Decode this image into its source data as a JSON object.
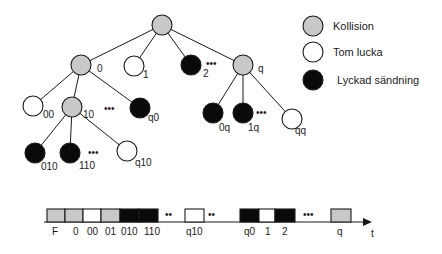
{
  "colors": {
    "collision": "#c8c8c8",
    "empty": "#ffffff",
    "success": "#0a0a0a",
    "stroke": "#1a1a1a"
  },
  "legend": [
    {
      "type": "collision",
      "label": "Kollision"
    },
    {
      "type": "empty",
      "label": "Tom lucka"
    },
    {
      "type": "success",
      "label": "Lyckad sändning"
    }
  ],
  "tree": {
    "nodes": [
      {
        "id": "root",
        "label": "",
        "type": "collision",
        "x": 162,
        "y": 25
      },
      {
        "id": "0",
        "label": "0",
        "type": "collision",
        "x": 81,
        "y": 65
      },
      {
        "id": "1",
        "label": "1",
        "type": "empty",
        "x": 134,
        "y": 66
      },
      {
        "id": "2",
        "label": "2",
        "type": "success",
        "x": 191,
        "y": 65
      },
      {
        "id": "q",
        "label": "q",
        "type": "collision",
        "x": 243,
        "y": 65
      },
      {
        "id": "00",
        "label": "00",
        "type": "empty",
        "x": 33,
        "y": 106
      },
      {
        "id": "10",
        "label": "10",
        "type": "collision",
        "x": 72,
        "y": 107
      },
      {
        "id": "q0",
        "label": "q0",
        "type": "success",
        "x": 140,
        "y": 108
      },
      {
        "id": "0q",
        "label": "0q",
        "type": "success",
        "x": 213,
        "y": 113
      },
      {
        "id": "1q",
        "label": "1q",
        "type": "success",
        "x": 243,
        "y": 113
      },
      {
        "id": "qq",
        "label": "qq",
        "type": "empty",
        "x": 292,
        "y": 119
      },
      {
        "id": "010",
        "label": "010",
        "type": "success",
        "x": 35,
        "y": 153
      },
      {
        "id": "110",
        "label": "110",
        "type": "success",
        "x": 70,
        "y": 153
      },
      {
        "id": "q10",
        "label": "q10",
        "type": "empty",
        "x": 127,
        "y": 151
      }
    ],
    "edges": [
      [
        "root",
        "0"
      ],
      [
        "root",
        "1"
      ],
      [
        "root",
        "2"
      ],
      [
        "root",
        "q"
      ],
      [
        "0",
        "00"
      ],
      [
        "0",
        "10"
      ],
      [
        "0",
        "q0"
      ],
      [
        "q",
        "0q"
      ],
      [
        "q",
        "1q"
      ],
      [
        "q",
        "qq"
      ],
      [
        "10",
        "010"
      ],
      [
        "10",
        "110"
      ],
      [
        "10",
        "q10"
      ]
    ],
    "ellipses": [
      "•••",
      "•••",
      "•••",
      "•••"
    ]
  },
  "timeline": {
    "slots": [
      {
        "label": "F",
        "type": "collision"
      },
      {
        "label": "0",
        "type": "collision"
      },
      {
        "label": "00",
        "type": "empty"
      },
      {
        "label": "01",
        "type": "collision"
      },
      {
        "label": "010",
        "type": "success"
      },
      {
        "label": "110",
        "type": "success"
      },
      {
        "label": "q10",
        "type": "empty"
      },
      {
        "label": "q0",
        "type": "success"
      },
      {
        "label": "1",
        "type": "empty"
      },
      {
        "label": "2",
        "type": "success"
      },
      {
        "label": "q",
        "type": "collision"
      }
    ],
    "axis_label": "t",
    "gap_marks": [
      "••",
      "••",
      "•••"
    ]
  }
}
